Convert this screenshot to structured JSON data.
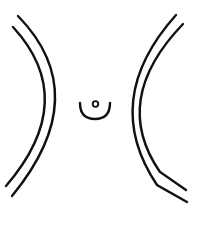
{
  "figure": {
    "stroke_color": "#111111",
    "background": "#ffffff",
    "stroke_width": 2.4
  },
  "shapes": {
    "left_outer_arc": "M18 16 Q 95 95 12 196",
    "left_inner_arc": "M13 27 Q 80 100 6 186",
    "right_outer_arc": "M176 15 Q 100 100 157 185 L 187 202",
    "right_inner_arc": "M183 24 Q 110 100 160 172 L 186 190",
    "cup": "M80 103 Q 80 119 95 119 Q 110 119 110 103",
    "dot": {
      "cx": 95.5,
      "cy": 104,
      "r": 2.8
    }
  }
}
